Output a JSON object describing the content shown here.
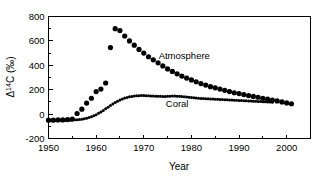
{
  "chart_data": {
    "type": "scatter",
    "title": "",
    "xlabel": "Year",
    "ylabel_parts": {
      "delta": "Δ",
      "sup": "14",
      "element": "C",
      "units": "(‰)"
    },
    "ylabel": "Δ 14C (‰)",
    "xlim": [
      1950,
      2005
    ],
    "ylim": [
      -200,
      800
    ],
    "xticks": [
      1950,
      1960,
      1970,
      1980,
      1990,
      2000
    ],
    "xtick_labels": [
      "1950",
      "1960",
      "1970",
      "1980",
      "1990",
      "2000"
    ],
    "xminor_ticks": [
      1955,
      1965,
      1975,
      1985,
      1995,
      2005
    ],
    "yticks": [
      -200,
      0,
      200,
      400,
      600,
      800
    ],
    "ytick_labels": [
      "-200",
      "0",
      "200",
      "400",
      "600",
      "800"
    ],
    "grid": false,
    "legend_position": "inline-annotation",
    "marker_color": "#000000",
    "frame_color": "#000000",
    "background": "#ffffff",
    "annotations": [
      {
        "text": "Atmosphere",
        "x": 1978.5,
        "y": 455
      },
      {
        "text": "Coral",
        "x": 1977.0,
        "y": 60
      }
    ],
    "series": [
      {
        "name": "Atmosphere",
        "marker": "circle",
        "marker_size": 2.6,
        "x": [
          1950,
          1951,
          1952,
          1953,
          1954,
          1955,
          1956,
          1957,
          1958,
          1959,
          1960,
          1961,
          1962,
          1963,
          1964,
          1965,
          1966,
          1967,
          1968,
          1969,
          1970,
          1971,
          1972,
          1973,
          1974,
          1975,
          1976,
          1977,
          1978,
          1979,
          1980,
          1981,
          1982,
          1983,
          1984,
          1985,
          1986,
          1987,
          1988,
          1989,
          1990,
          1991,
          1992,
          1993,
          1994,
          1995,
          1996,
          1997,
          1998,
          1999,
          2000,
          2001
        ],
        "y": [
          -50,
          -50,
          -48,
          -48,
          -45,
          -40,
          5,
          40,
          90,
          130,
          185,
          205,
          255,
          545,
          700,
          685,
          640,
          600,
          565,
          530,
          500,
          470,
          445,
          420,
          395,
          370,
          350,
          330,
          312,
          295,
          280,
          265,
          250,
          238,
          225,
          215,
          205,
          195,
          185,
          175,
          168,
          160,
          152,
          145,
          138,
          130,
          122,
          115,
          108,
          100,
          92,
          85
        ]
      },
      {
        "name": "Coral",
        "marker": "circle",
        "marker_size": 1.5,
        "x": [
          1950.0,
          1950.5,
          1951.0,
          1951.5,
          1952.0,
          1952.5,
          1953.0,
          1953.5,
          1954.0,
          1954.5,
          1955.0,
          1955.5,
          1956.0,
          1956.5,
          1957.0,
          1957.5,
          1958.0,
          1958.5,
          1959.0,
          1959.5,
          1960.0,
          1960.5,
          1961.0,
          1961.5,
          1962.0,
          1962.5,
          1963.0,
          1963.5,
          1964.0,
          1964.5,
          1965.0,
          1965.5,
          1966.0,
          1966.5,
          1967.0,
          1967.5,
          1968.0,
          1968.5,
          1969.0,
          1969.5,
          1970.0,
          1970.5,
          1971.0,
          1971.5,
          1972.0,
          1972.5,
          1973.0,
          1973.5,
          1974.0,
          1974.5,
          1975.0,
          1975.5,
          1976.0,
          1976.5,
          1977.0,
          1977.5,
          1978.0,
          1978.5,
          1979.0,
          1979.5,
          1980.0,
          1980.5,
          1981.0,
          1981.5,
          1982.0,
          1982.5,
          1983.0,
          1983.5,
          1984.0,
          1984.5,
          1985.0,
          1985.5,
          1986.0,
          1986.5,
          1987.0,
          1987.5,
          1988.0,
          1988.5,
          1989.0,
          1989.5,
          1990.0,
          1990.5,
          1991.0,
          1991.5,
          1992.0,
          1992.5,
          1993.0,
          1993.5,
          1994.0,
          1994.5,
          1995.0,
          1995.5,
          1996.0,
          1996.5,
          1997.0
        ],
        "y": [
          -52,
          -53,
          -52,
          -51,
          -52,
          -50,
          -51,
          -50,
          -49,
          -50,
          -48,
          -47,
          -46,
          -44,
          -42,
          -38,
          -34,
          -28,
          -22,
          -14,
          -5,
          6,
          18,
          30,
          43,
          56,
          70,
          83,
          95,
          106,
          116,
          124,
          131,
          137,
          142,
          145,
          148,
          150,
          151,
          152,
          152,
          151,
          150,
          149,
          148,
          147,
          146,
          146,
          145,
          145,
          146,
          147,
          148,
          148,
          147,
          146,
          144,
          142,
          140,
          138,
          136,
          134,
          132,
          130,
          128,
          127,
          126,
          125,
          124,
          123,
          122,
          121,
          120,
          119,
          118,
          117,
          116,
          115,
          114,
          113,
          112,
          111,
          110,
          109,
          108,
          107,
          106,
          105,
          104,
          103,
          102,
          101,
          100,
          99,
          98
        ]
      }
    ]
  },
  "axis": {
    "ylabel_delta": "Δ",
    "ylabel_sup": "14",
    "ylabel_rest": "C (‰)",
    "xlabel": "Year"
  }
}
